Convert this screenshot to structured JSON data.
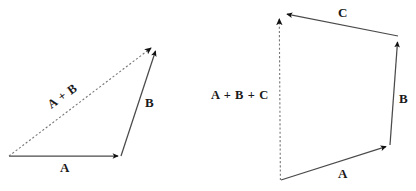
{
  "figure": {
    "background_color": "#ffffff",
    "stroke_color": "#3c3c3c",
    "arrowhead_color": "#1a1a1a",
    "text_color": "#1a1a1a"
  },
  "diagrams": [
    {
      "id": "left",
      "name": "two-vector-addition",
      "caption": "Triangle rule: A + B",
      "vectors": [
        {
          "label": "A",
          "style": "solid",
          "from": [
            9,
            156
          ],
          "to": [
            121,
            156
          ]
        },
        {
          "label": "B",
          "style": "solid",
          "from": [
            121,
            156
          ],
          "to": [
            157,
            46
          ]
        },
        {
          "label": "A + B",
          "style": "dashed",
          "from": [
            9,
            156
          ],
          "to": [
            156,
            44
          ]
        }
      ]
    },
    {
      "id": "right",
      "name": "three-vector-addition",
      "caption": "Polygon rule: A + B + C",
      "vectors": [
        {
          "label": "A",
          "style": "solid",
          "from": [
            281,
            180
          ],
          "to": [
            390,
            145
          ]
        },
        {
          "label": "B",
          "style": "solid",
          "from": [
            390,
            145
          ],
          "to": [
            398,
            36
          ]
        },
        {
          "label": "C",
          "style": "solid",
          "from": [
            398,
            36
          ],
          "to": [
            281,
            13
          ]
        },
        {
          "label": "A + B + C",
          "style": "dashed",
          "from": [
            280,
            180
          ],
          "to": [
            279,
            13
          ]
        }
      ]
    }
  ],
  "labels": {
    "left_a": "A",
    "left_b": "B",
    "left_sum": "A + B",
    "right_a": "A",
    "right_b": "B",
    "right_c": "C",
    "right_sum": "A + B + C"
  }
}
